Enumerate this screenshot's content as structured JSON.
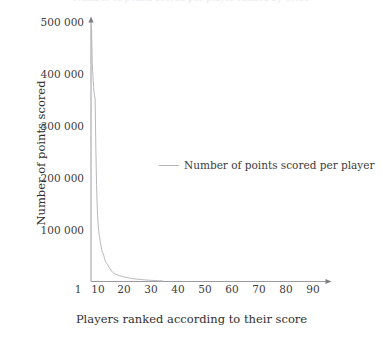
{
  "figure": {
    "top_title_sliver": "Number of points scored per player ranked by score"
  },
  "axes": {
    "ylabel": "Number of points scored",
    "xlabel": "Players ranked according to their score",
    "y_ticks": [
      "100 000",
      "200 000",
      "300 000",
      "400 000",
      "500 000"
    ],
    "x_ticks": [
      "1",
      "10",
      "20",
      "30",
      "40",
      "50",
      "60",
      "70",
      "80",
      "90"
    ]
  },
  "legend": {
    "entries": [
      {
        "label": "Number of points scored per player",
        "color": "#b9b9bd",
        "marker": "line"
      }
    ]
  },
  "colors": {
    "line": "#b9b9bd",
    "axis": "#8f8f95",
    "text": "#3c3c3c",
    "background": "#ffffff"
  },
  "chart_data": {
    "type": "line",
    "title": "Number of points scored per player ranked by score",
    "xlabel": "Players ranked according to their score",
    "ylabel": "Number of points scored",
    "xlim": [
      1,
      100
    ],
    "ylim": [
      0,
      500000
    ],
    "grid": false,
    "legend_position": "center",
    "xticks": [
      1,
      10,
      20,
      30,
      40,
      50,
      60,
      70,
      80,
      90
    ],
    "yticks": [
      0,
      100000,
      200000,
      300000,
      400000,
      500000
    ],
    "series": [
      {
        "name": "Number of points scored per player",
        "color": "#b9b9bd",
        "x": [
          1,
          2,
          3,
          4,
          5,
          6,
          7,
          8,
          9,
          10,
          11,
          12,
          13,
          14,
          15,
          16,
          17,
          18,
          19,
          20,
          21,
          22,
          23,
          24,
          25,
          26,
          27,
          28,
          29,
          30,
          32,
          34,
          36,
          38,
          40,
          45,
          50,
          55,
          60,
          65,
          70,
          75,
          80,
          85,
          90,
          95,
          100
        ],
        "values": [
          490000,
          420000,
          395000,
          372000,
          358000,
          352000,
          256000,
          186000,
          140000,
          112000,
          96000,
          86000,
          78000,
          70000,
          62000,
          57000,
          54000,
          50000,
          44000,
          40000,
          37000,
          35000,
          33000,
          31000,
          28000,
          26000,
          24000,
          22000,
          20000,
          18000,
          16000,
          14500,
          13000,
          12000,
          11000,
          9000,
          7500,
          6200,
          5200,
          4400,
          3700,
          3100,
          2600,
          2200,
          1800,
          1400,
          1000
        ]
      }
    ]
  }
}
